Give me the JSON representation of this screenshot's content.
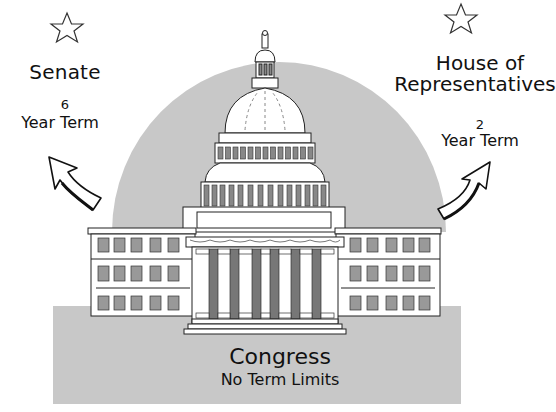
{
  "diagram": {
    "colors": {
      "background": "#ffffff",
      "shade": "#c8c8c8",
      "column_dark": "#7a7a7a",
      "window": "#9a9a9a",
      "outline": "#222222"
    },
    "senate": {
      "icon": "star-outline-icon",
      "title": "Senate",
      "term_number": "6",
      "term_label": "Year Term",
      "arrow": "curved-arrow-up-left-icon"
    },
    "house": {
      "icon": "star-outline-icon",
      "title_line1": "House of",
      "title_line2": "Representatives",
      "term_number": "2",
      "term_label": "Year Term",
      "arrow": "curved-arrow-up-right-icon"
    },
    "center": {
      "image": "capitol-building-illustration",
      "title": "Congress",
      "subtitle": "No Term Limits"
    }
  }
}
